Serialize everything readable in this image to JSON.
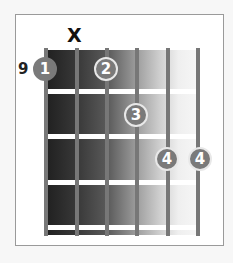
{
  "chord": {
    "start_fret_label": "9",
    "muted_string_marker": "X",
    "muted_string": 2,
    "num_strings": 6,
    "num_frets_shown": 4,
    "fingers": [
      {
        "label": "1",
        "string": 1,
        "fret": 1
      },
      {
        "label": "2",
        "string": 3,
        "fret": 1
      },
      {
        "label": "3",
        "string": 4,
        "fret": 2
      },
      {
        "label": "4",
        "string": 5,
        "fret": 3
      },
      {
        "label": "4",
        "string": 6,
        "fret": 3
      }
    ]
  },
  "colors": {
    "string": "#777777",
    "fret": "#ffffff",
    "finger_fill": "#7a7a7a",
    "finger_text": "#ffffff",
    "frame_border": "#9a9a9a"
  }
}
